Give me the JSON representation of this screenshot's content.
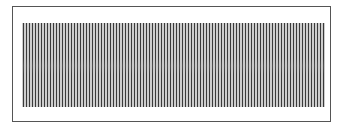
{
  "figure": {
    "type": "vertical-line-pattern",
    "line_count": 101,
    "line_color": "#3a3a3a",
    "background": "#ffffff",
    "frame_color": "#555555"
  }
}
